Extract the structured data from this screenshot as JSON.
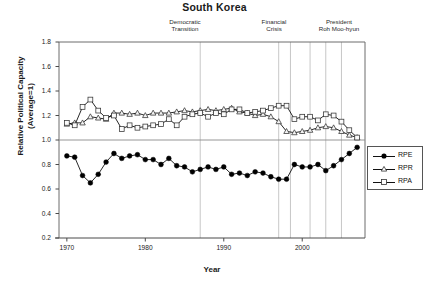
{
  "chart_data": {
    "type": "line",
    "title": "South Korea",
    "xlabel": "Year",
    "ylabel": "Relative Political Capacity (Average=1)",
    "ylabel_line1": "Relative Political Capacity",
    "ylabel_line2": "(Average=1)",
    "xlim": [
      1969,
      2008
    ],
    "ylim": [
      0.2,
      1.8
    ],
    "yticks": [
      "0.2",
      "0.4",
      "0.6",
      "0.8",
      "1.0",
      "1.2",
      "1.4",
      "1.6",
      "1.8"
    ],
    "ytick_values": [
      0.2,
      0.4,
      0.6,
      0.8,
      1.0,
      1.2,
      1.4,
      1.6,
      1.8
    ],
    "xticks": [
      "1970",
      "1980",
      "1990",
      "2000"
    ],
    "xtick_values": [
      1970,
      1980,
      1990,
      2000
    ],
    "grid": false,
    "reference_line_y": 1.0,
    "legend_position": "right-outside",
    "annotations": [
      {
        "label_line1": "Democratic",
        "label_line2": "Transition",
        "x": 1987
      },
      {
        "label_line1": "Financial",
        "label_line2": "Crisis",
        "x": 1997
      },
      {
        "label_line1": "President",
        "label_line2": "Roh Moo-hyun",
        "x": 2003
      }
    ],
    "vlines": [
      1987,
      1997,
      1998.5,
      2001,
      2003,
      2005
    ],
    "x": [
      1970,
      1971,
      1972,
      1973,
      1974,
      1975,
      1976,
      1977,
      1978,
      1979,
      1980,
      1981,
      1982,
      1983,
      1984,
      1985,
      1986,
      1987,
      1988,
      1989,
      1990,
      1991,
      1992,
      1993,
      1994,
      1995,
      1996,
      1997,
      1998,
      1999,
      2000,
      2001,
      2002,
      2003,
      2004,
      2005,
      2006,
      2007
    ],
    "series": [
      {
        "name": "RPE",
        "marker": "filled-circle",
        "color": "#000000",
        "values": [
          0.87,
          0.86,
          0.71,
          0.65,
          0.72,
          0.82,
          0.89,
          0.85,
          0.87,
          0.88,
          0.84,
          0.84,
          0.8,
          0.85,
          0.79,
          0.78,
          0.74,
          0.76,
          0.78,
          0.76,
          0.78,
          0.72,
          0.73,
          0.71,
          0.74,
          0.73,
          0.7,
          0.68,
          0.68,
          0.8,
          0.78,
          0.78,
          0.8,
          0.75,
          0.79,
          0.84,
          0.89,
          0.94
        ]
      },
      {
        "name": "RPR",
        "marker": "open-triangle",
        "color": "#000000",
        "values": [
          1.13,
          1.14,
          1.14,
          1.19,
          1.18,
          1.17,
          1.22,
          1.22,
          1.21,
          1.22,
          1.2,
          1.22,
          1.22,
          1.22,
          1.23,
          1.24,
          1.23,
          1.24,
          1.25,
          1.24,
          1.25,
          1.26,
          1.23,
          1.22,
          1.2,
          1.21,
          1.19,
          1.15,
          1.07,
          1.06,
          1.07,
          1.08,
          1.1,
          1.11,
          1.1,
          1.07,
          1.04,
          1.02
        ]
      },
      {
        "name": "RPA",
        "marker": "open-square",
        "color": "#000000",
        "values": [
          1.14,
          1.12,
          1.27,
          1.33,
          1.24,
          1.18,
          1.2,
          1.09,
          1.12,
          1.1,
          1.11,
          1.12,
          1.13,
          1.17,
          1.12,
          1.19,
          1.21,
          1.22,
          1.19,
          1.22,
          1.21,
          1.25,
          1.25,
          1.22,
          1.23,
          1.24,
          1.26,
          1.28,
          1.28,
          1.17,
          1.19,
          1.19,
          1.16,
          1.21,
          1.2,
          1.15,
          1.08,
          1.02
        ]
      }
    ],
    "legend": [
      {
        "label": "RPE",
        "marker": "filled-circle"
      },
      {
        "label": "RPR",
        "marker": "open-triangle"
      },
      {
        "label": "RPA",
        "marker": "open-square"
      }
    ]
  }
}
